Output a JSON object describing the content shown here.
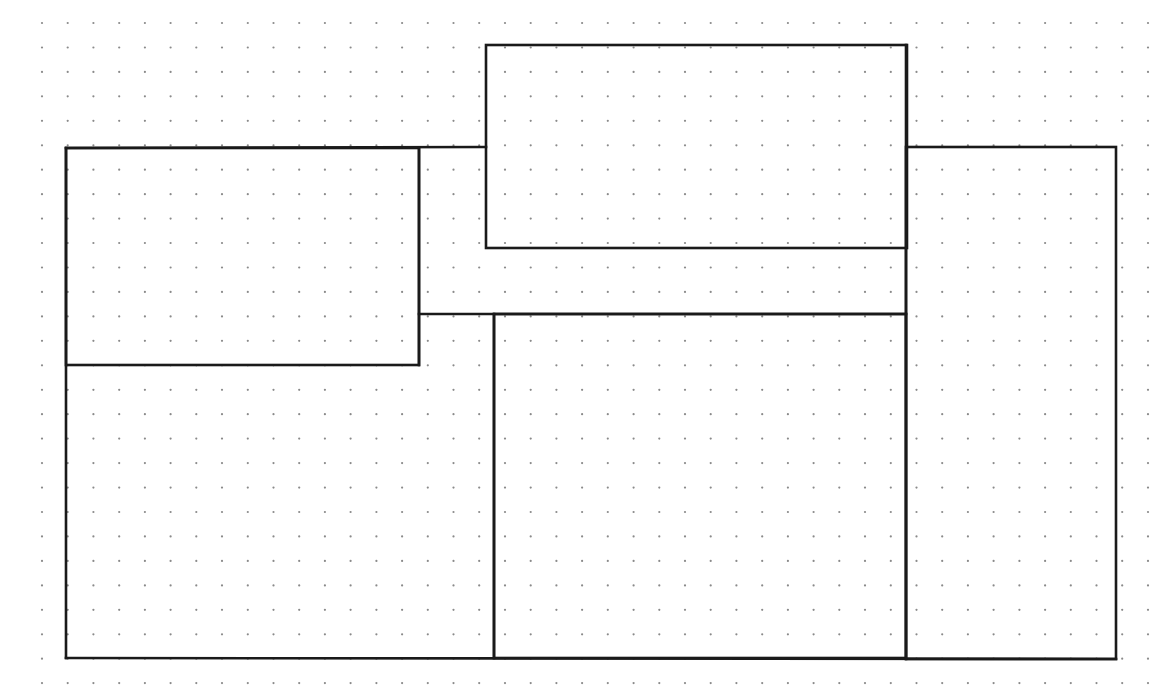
{
  "canvas": {
    "width": 1172,
    "height": 698,
    "background": "#ffffff"
  },
  "dot_grid": {
    "x_start": 42,
    "y_start": 23,
    "x_step": 25.72,
    "y_step": 24.45,
    "cols": 44,
    "rows": 28,
    "radius": 1.1,
    "color": "#8a8a8a"
  },
  "line_color": "#1a1a1a",
  "line_width": 2.6,
  "rectangles": [
    {
      "name": "top-center-rect",
      "x": 486,
      "y": 45,
      "w": 421,
      "h": 203
    },
    {
      "name": "left-upper-rect",
      "x": 66,
      "y": 148,
      "w": 353,
      "h": 217
    },
    {
      "name": "bottom-center-rect",
      "x": 494,
      "y": 314,
      "w": 412,
      "h": 344
    },
    {
      "name": "right-rect",
      "x": 906,
      "y": 147,
      "w": 210,
      "h": 512
    }
  ],
  "segments": [
    {
      "name": "outer-top-left-edge",
      "x1": 66,
      "y1": 148,
      "x2": 486,
      "y2": 147
    },
    {
      "name": "outer-left-edge",
      "x1": 66,
      "y1": 148,
      "x2": 66,
      "y2": 658
    },
    {
      "name": "outer-bottom-edge",
      "x1": 66,
      "y1": 658,
      "x2": 1116,
      "y2": 659
    },
    {
      "name": "middle-connector-edge",
      "x1": 419,
      "y1": 314,
      "x2": 906,
      "y2": 314
    },
    {
      "name": "inner-divider-vertical",
      "x1": 419,
      "y1": 148,
      "x2": 419,
      "y2": 365
    },
    {
      "name": "center-divider-vertical",
      "x1": 494,
      "y1": 314,
      "x2": 494,
      "y2": 658
    },
    {
      "name": "right-divider-vertical",
      "x1": 906,
      "y1": 45,
      "x2": 906,
      "y2": 659
    }
  ]
}
